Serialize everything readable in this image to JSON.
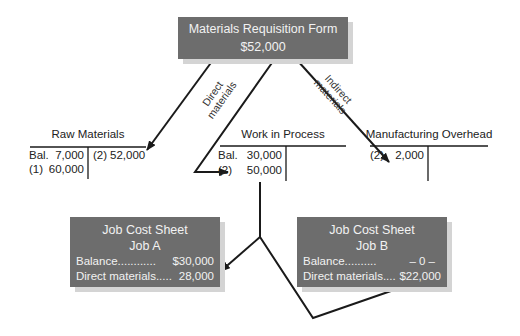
{
  "requisition": {
    "title": "Materials Requisition Form",
    "amount": "$52,000"
  },
  "arrow_labels": {
    "direct_line1": "Direct",
    "direct_line2": "materials",
    "indirect_line1": "Indirect",
    "indirect_line2": "materials"
  },
  "accounts": {
    "raw_materials": {
      "title": "Raw Materials",
      "debits": [
        {
          "ref": "Bal.",
          "amount": "7,000"
        },
        {
          "ref": "(1)",
          "amount": "60,000"
        }
      ],
      "credits": [
        {
          "ref": "(2)",
          "amount": "52,000"
        }
      ]
    },
    "work_in_process": {
      "title": "Work in Process",
      "debits": [
        {
          "ref": "Bal.",
          "amount": "30,000"
        },
        {
          "ref": "(2)",
          "amount": "50,000"
        }
      ],
      "credits": []
    },
    "manufacturing_overhead": {
      "title": "Manufacturing Overhead",
      "debits": [
        {
          "ref": "(2)",
          "amount": "2,000"
        }
      ],
      "credits": []
    }
  },
  "job_sheets": {
    "job_a": {
      "title": "Job Cost Sheet",
      "job": "Job A",
      "balance_label": "Balance",
      "balance_dots": "............",
      "balance_value": "$30,000",
      "dm_label": "Direct materials",
      "dm_dots": ".....",
      "dm_value": "28,000"
    },
    "job_b": {
      "title": "Job Cost Sheet",
      "job": "Job B",
      "balance_label": "Balance",
      "balance_dots": "..........",
      "balance_value": "– 0 –",
      "dm_label": "Direct materials",
      "dm_dots": "....",
      "dm_value": "$22,000"
    }
  },
  "colors": {
    "box_fill": "#6d6d6d",
    "box_text": "#f2f2f2",
    "box_shadow": "#d4d4d4",
    "line": "#1a1a1a"
  }
}
